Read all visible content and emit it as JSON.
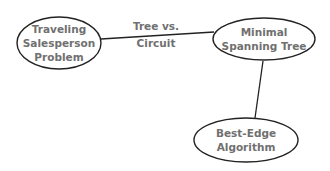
{
  "diagram": {
    "nodes": [
      {
        "id": "tsp",
        "lines": [
          "Traveling",
          "Salesperson",
          "Problem"
        ]
      },
      {
        "id": "mst",
        "lines": [
          "Minimal",
          "Spanning Tree"
        ]
      },
      {
        "id": "best-edge",
        "lines": [
          "Best-Edge",
          "Algorithm"
        ]
      }
    ],
    "edges": [
      {
        "from": "tsp",
        "to": "mst",
        "label_lines": [
          "Tree vs.",
          "Circuit"
        ]
      },
      {
        "from": "mst",
        "to": "best-edge",
        "label_lines": []
      }
    ]
  }
}
